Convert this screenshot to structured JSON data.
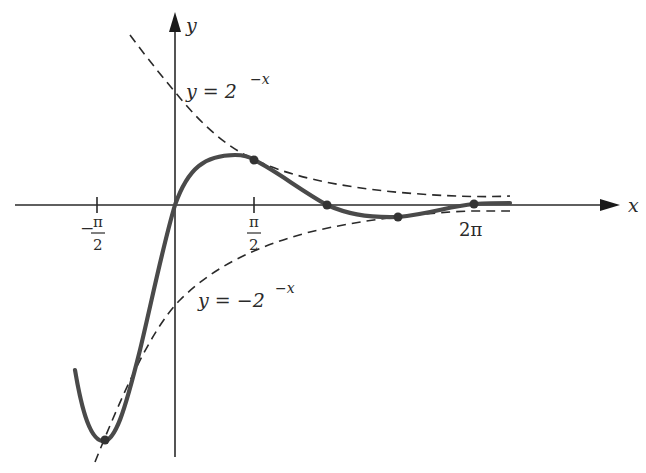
{
  "figure": {
    "type": "function-plot"
  },
  "axes": {
    "x_label": "x",
    "y_label": "y",
    "x_ticks": [
      {
        "label_num": "π",
        "label_den": "2",
        "sign": "−",
        "value": "-π/2"
      },
      {
        "label_num": "π",
        "label_den": "2",
        "sign": "",
        "value": "π/2"
      },
      {
        "label": "2π",
        "value": "2π"
      }
    ]
  },
  "curves": {
    "upper_envelope": {
      "label_lhs": "y = 2",
      "label_exp": "−x",
      "style": "dashed"
    },
    "lower_envelope": {
      "label_lhs": "y = −2",
      "label_exp": "−x",
      "style": "dashed"
    },
    "main_curve": {
      "style": "solid-thick"
    }
  },
  "marked_points": [
    {
      "x_px": 105,
      "y_px": 440
    },
    {
      "x_px": 254,
      "y_px": 160
    },
    {
      "x_px": 327,
      "y_px": 205
    },
    {
      "x_px": 398,
      "y_px": 217
    },
    {
      "x_px": 474,
      "y_px": 204
    }
  ],
  "colors": {
    "ink": "#2a2a2a",
    "curve": "#4a4a4a",
    "background": "#ffffff"
  }
}
